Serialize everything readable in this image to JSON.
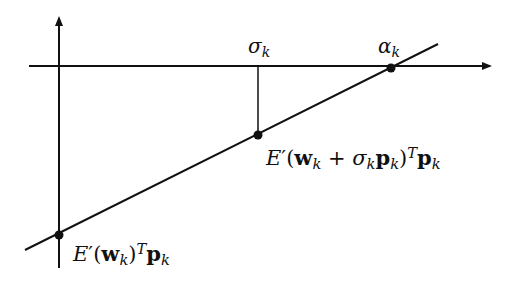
{
  "diagram": {
    "type": "line-search-secant-diagram",
    "colors": {
      "stroke": "#111111",
      "background": "#ffffff"
    },
    "axes": {
      "vertical": {
        "x": 59,
        "y_top": 15,
        "y_bottom": 268,
        "arrow": "up"
      },
      "horizontal": {
        "y": 66,
        "x_left": 29,
        "x_right": 492,
        "arrow": "right"
      }
    },
    "line": {
      "x1": 25,
      "y1": 250,
      "x2": 438,
      "y2": 44
    },
    "points": [
      {
        "id": "origin-slope",
        "x": 59,
        "y": 235
      },
      {
        "id": "sigma-slope",
        "x": 258,
        "y": 135
      },
      {
        "id": "alpha-root",
        "x": 391,
        "y": 68
      }
    ],
    "drop_line": {
      "x": 258,
      "y1": 66,
      "y2": 135
    },
    "labels": {
      "sigma": {
        "base": "σ",
        "sub": "k"
      },
      "alpha": {
        "base": "α",
        "sub": "k"
      },
      "slope_sigma": {
        "E": "E",
        "prime": "′",
        "open": "(",
        "w": "w",
        "w_sub": "k",
        "plus": " + ",
        "sigma": "σ",
        "sigma_sub": "k",
        "p1": "p",
        "p1_sub": "k",
        "close": ")",
        "T": "T",
        "p2": "p",
        "p2_sub": "k"
      },
      "slope_origin": {
        "E": "E",
        "prime": "′",
        "open": "(",
        "w": "w",
        "w_sub": "k",
        "close": ")",
        "T": "T",
        "p": "p",
        "p_sub": "k"
      }
    }
  }
}
